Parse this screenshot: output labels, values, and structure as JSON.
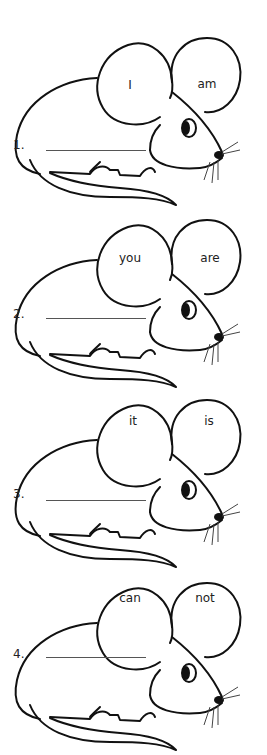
{
  "worksheet": {
    "items": [
      {
        "number": "1.",
        "word1": "I",
        "word2": "am",
        "answer": ""
      },
      {
        "number": "2.",
        "word1": "you",
        "word2": "are",
        "answer": ""
      },
      {
        "number": "3.",
        "word1": "it",
        "word2": "is",
        "answer": ""
      },
      {
        "number": "4.",
        "word1": "can",
        "word2": "not",
        "answer": ""
      }
    ]
  },
  "colors": {
    "ink": "#111111",
    "line": "#555555",
    "background": "#ffffff"
  }
}
